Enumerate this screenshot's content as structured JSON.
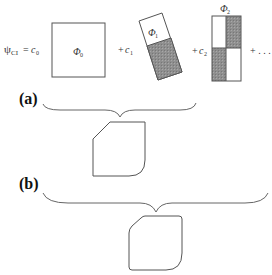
{
  "equation": {
    "lhs": "ψ",
    "lhs_sub": "CI",
    "equals": "=",
    "coef0": "c",
    "coef0_sub": "0",
    "plus1": "+",
    "coef1": "c",
    "coef1_sub": "1",
    "plus2": "+",
    "coef2": "c",
    "coef2_sub": "2",
    "trailing": "+ . . ."
  },
  "configurations": [
    {
      "label": "Φ",
      "sub": "0",
      "shading": "none"
    },
    {
      "label": "Φ",
      "sub": "1",
      "shading": "lower-half"
    },
    {
      "label": "Φ",
      "sub": "2",
      "shading": "diagonal-checker"
    }
  ],
  "panels": [
    {
      "label": "(a)"
    },
    {
      "label": "(b)"
    }
  ],
  "colors": {
    "stroke": "#555555",
    "shade": "#8a8a8a",
    "background": "#ffffff"
  }
}
